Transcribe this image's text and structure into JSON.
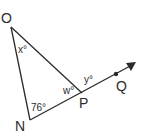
{
  "diagram": {
    "type": "geometry-triangle",
    "vertices": {
      "O": {
        "label": "O",
        "angle_label": "x°"
      },
      "N": {
        "label": "N",
        "angle_label": "76°"
      },
      "P": {
        "label": "P",
        "interior_angle_label": "w°",
        "exterior_angle_label": "y°"
      },
      "Q": {
        "label": "Q"
      }
    },
    "segments": [
      "ON",
      "NP",
      "OP",
      "PQ (ray extending NP)"
    ],
    "colors": {
      "stroke": "#2b2b2b",
      "background": "#ffffff"
    }
  }
}
